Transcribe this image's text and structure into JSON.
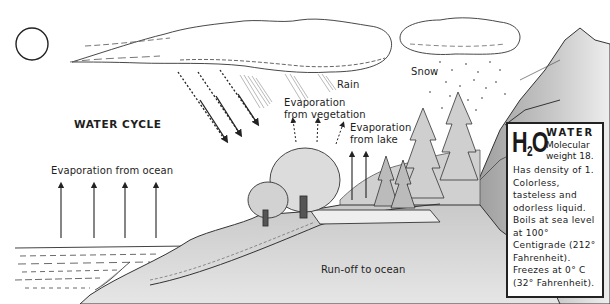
{
  "diagram": {
    "title": "WATER CYCLE",
    "labels": {
      "rain": "Rain",
      "snow": "Snow",
      "evaporation_vegetation_line1": "Evaporation",
      "evaporation_vegetation_line2": "from vegetation",
      "evaporation_lake_line1": "Evaporation",
      "evaporation_lake_line2": "from lake",
      "evaporation_ocean": "Evaporation from ocean",
      "runoff": "Run-off to ocean"
    },
    "elements": [
      "sun",
      "long-rain-cloud",
      "snow-cloud",
      "rain-streaks",
      "snowflakes",
      "ocean",
      "shoreline",
      "trees",
      "pine-trees",
      "lake",
      "mountain-cliff",
      "evaporation-arrows"
    ],
    "infobox": {
      "formula_main": "H",
      "formula_sub": "2",
      "formula_end": "O",
      "heading": "WATER",
      "molecular_line1": "Molecular",
      "molecular_line2": "weight 18.",
      "body": "Has density of 1. Colorless, tasteless and odorless liquid. Boils at sea level at 100° Centigrade (212° Fahrenheit). Freezes at 0° C (32° Fahrenheit)."
    }
  }
}
